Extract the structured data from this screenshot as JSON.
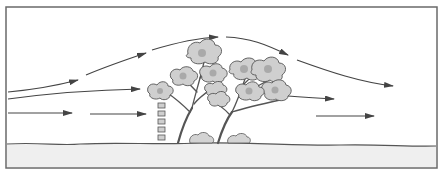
{
  "diagram": {
    "colors": {
      "frame": "#6a6a6a",
      "arrow": "#444444",
      "ground": "#efefef",
      "foliage": "#cfcfcf"
    },
    "elements": {
      "flow_lines": [
        {
          "id": "upper",
          "description": "Airflow rising over the tree canopy then descending downwind",
          "segments": 4
        },
        {
          "id": "middle",
          "description": "Airflow entering and passing through the canopy",
          "segments": 2
        },
        {
          "id": "lower",
          "description": "Near-ground airflow approaching and leaving the windbreak",
          "segments": 4
        }
      ],
      "trees": 2,
      "shrubs": 2,
      "fence_blocks": 5
    }
  }
}
